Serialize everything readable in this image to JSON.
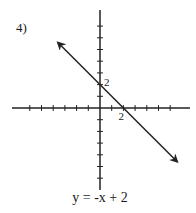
{
  "problem": {
    "number_label": "4)"
  },
  "equation": {
    "label": "y = -x + 2"
  },
  "colors": {
    "axis": "#222222",
    "line": "#222222",
    "text": "#1a1a1a",
    "background": "#ffffff"
  },
  "chart_data": {
    "type": "line",
    "title": "4)",
    "xlabel": "",
    "ylabel": "",
    "equation": "y = -x + 2",
    "slope": -1,
    "intercept": 2,
    "xlim": [
      -8,
      8
    ],
    "ylim": [
      -7,
      8
    ],
    "grid": false,
    "tick_spacing": 1,
    "x_ticks": [
      -6,
      -5,
      -4,
      -3,
      -2,
      -1,
      1,
      2,
      3,
      4,
      5,
      6
    ],
    "y_ticks": [
      -6,
      -5,
      -4,
      -3,
      -2,
      -1,
      1,
      2,
      3,
      4,
      5,
      6,
      7
    ],
    "annotations": [
      {
        "text": "2",
        "at": [
          0,
          2
        ],
        "meaning": "y-intercept"
      },
      {
        "text": "2",
        "at": [
          2,
          0
        ],
        "meaning": "x-intercept"
      }
    ],
    "series": [
      {
        "name": "y = -x + 2",
        "x": [
          -3.6,
          6.6
        ],
        "y": [
          5.6,
          -4.6
        ],
        "arrows": "both"
      }
    ]
  },
  "layout": {
    "origin_px": [
      100,
      108
    ],
    "unit_px": 11.7,
    "x_axis_px": [
      12,
      190
    ],
    "y_axis_px": [
      10,
      190
    ]
  }
}
